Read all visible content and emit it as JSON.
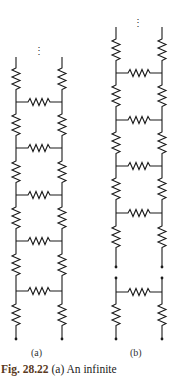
{
  "figure": {
    "label_a": "(a)",
    "label_b": "(b)",
    "caption_prefix": "Fig. 28.22",
    "caption_text": " (a) An infinite"
  },
  "diagram": {
    "stroke_color": "#1a1a1a",
    "continuation_glyph": "⋮",
    "circuit_a": {
      "left_rail_x": 16,
      "right_rail_x": 62,
      "top_y": 57,
      "bottom_y": 339,
      "rungs_y": [
        102,
        148,
        195,
        241,
        291
      ],
      "description": "Infinite ladder of resistors: vertical resistors on both rails, horizontal resistor rungs"
    },
    "circuit_b": {
      "left_rail_x": 116,
      "right_rail_x": 162,
      "top_y": 27,
      "break_top_y": 267,
      "break_bottom_y": 278,
      "bottom_y": 339,
      "rungs_y": [
        73,
        120,
        166,
        213
      ],
      "bottom_rung_y": 292,
      "description": "Same infinite ladder split into infinite part and one detached section"
    }
  }
}
